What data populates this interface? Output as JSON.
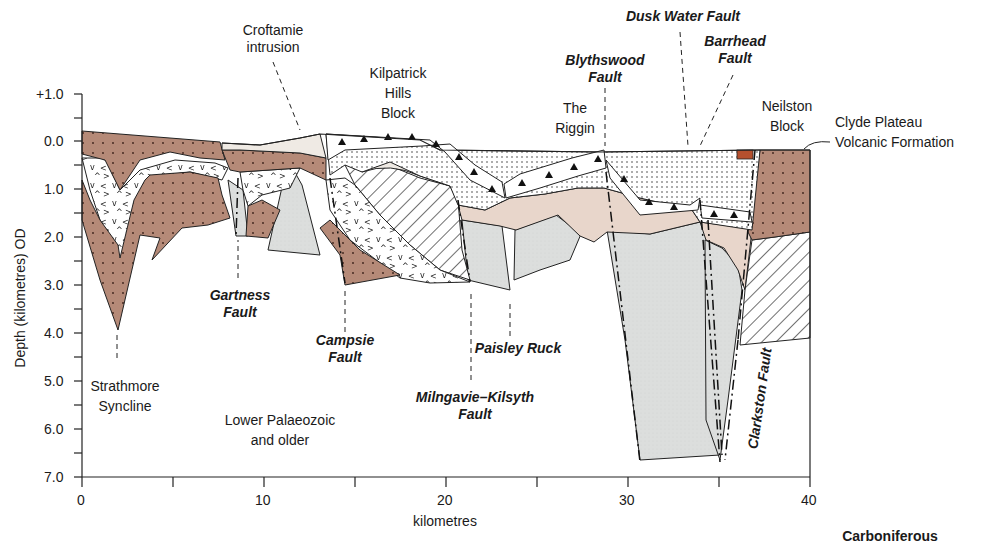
{
  "figure": {
    "category_label": "Carboniferous",
    "y_axis": {
      "title": "Depth (kilometres) OD",
      "ticks": [
        "+1.0",
        "0.0",
        "1.0",
        "2.0",
        "3.0",
        "4.0",
        "5.0",
        "6.0",
        "7.0"
      ],
      "range": [
        1.0,
        -7.0
      ]
    },
    "x_axis": {
      "title": "kilometres",
      "ticks": [
        "0",
        "10",
        "20",
        "30",
        "40"
      ],
      "range": [
        0,
        40
      ]
    },
    "labels": {
      "croftamie": [
        "Croftamie",
        "intrusion"
      ],
      "kilpatrick": [
        "Kilpatrick",
        "Hills",
        "Block"
      ],
      "riggin": [
        "The",
        "Riggin"
      ],
      "neilston": [
        "Neilston",
        "Block"
      ],
      "clyde": [
        "Clyde Plateau",
        "Volcanic Formation"
      ],
      "strathmore": [
        "Strathmore",
        "Syncline"
      ],
      "lower_palaeozoic": [
        "Lower Palaeozoic",
        "and older"
      ]
    },
    "faults": {
      "blythswood": [
        "Blythswood",
        "Fault"
      ],
      "dusk_water": "Dusk Water Fault",
      "barrhead": [
        "Barrhead",
        "Fault"
      ],
      "gartness": [
        "Gartness",
        "Fault"
      ],
      "campsie": [
        "Campsie",
        "Fault"
      ],
      "milngavie": [
        "Milngavie–Kilsyth",
        "Fault"
      ],
      "paisley": "Paisley Ruck",
      "clarkston": "Clarkston Fault"
    },
    "colors": {
      "sandstone_brown": "#b58a78",
      "light_grey": "#dcdedd",
      "pale_pink": "#e8d6cb",
      "pale_cream": "#efeae4",
      "red_block": "#b5502e",
      "line": "#1a1a1a"
    }
  }
}
